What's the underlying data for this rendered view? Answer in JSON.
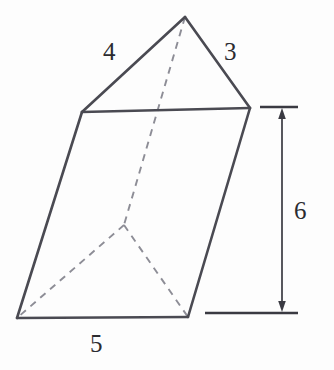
{
  "figure": {
    "name": "triangular-prism",
    "background_color": "#fdfdfd",
    "solid_edge_color": "#4a4a52",
    "hidden_edge_color": "#8d8d96",
    "dimension_color": "#3a3a42"
  },
  "labels": {
    "edge_left_top": "4",
    "edge_right_top": "3",
    "edge_bottom_front": "5",
    "height": "6"
  },
  "geometry": {
    "vertices": {
      "apex_back_top": [
        185,
        17
      ],
      "top_left_front": [
        82,
        112
      ],
      "top_right_front": [
        250,
        108
      ],
      "bottom_left_front": [
        17,
        318
      ],
      "bottom_right_front": [
        188,
        317
      ],
      "bottom_back_hidden": [
        124,
        225
      ]
    },
    "solid_edges": [
      [
        [
          82,
          112
        ],
        [
          185,
          17
        ]
      ],
      [
        [
          185,
          17
        ],
        [
          250,
          108
        ]
      ],
      [
        [
          82,
          112
        ],
        [
          250,
          108
        ]
      ],
      [
        [
          82,
          112
        ],
        [
          17,
          318
        ]
      ],
      [
        [
          250,
          108
        ],
        [
          188,
          317
        ]
      ],
      [
        [
          17,
          318
        ],
        [
          188,
          317
        ]
      ]
    ],
    "hidden_edges": [
      [
        [
          185,
          17
        ],
        [
          124,
          225
        ]
      ],
      [
        [
          124,
          225
        ],
        [
          17,
          318
        ]
      ],
      [
        [
          124,
          225
        ],
        [
          188,
          317
        ]
      ]
    ]
  },
  "dimension": {
    "axis_x": 282,
    "top_y": 110,
    "bottom_y": 308,
    "top_tick": [
      260,
      298,
      107
    ],
    "bottom_tick": [
      205,
      298,
      313
    ]
  }
}
